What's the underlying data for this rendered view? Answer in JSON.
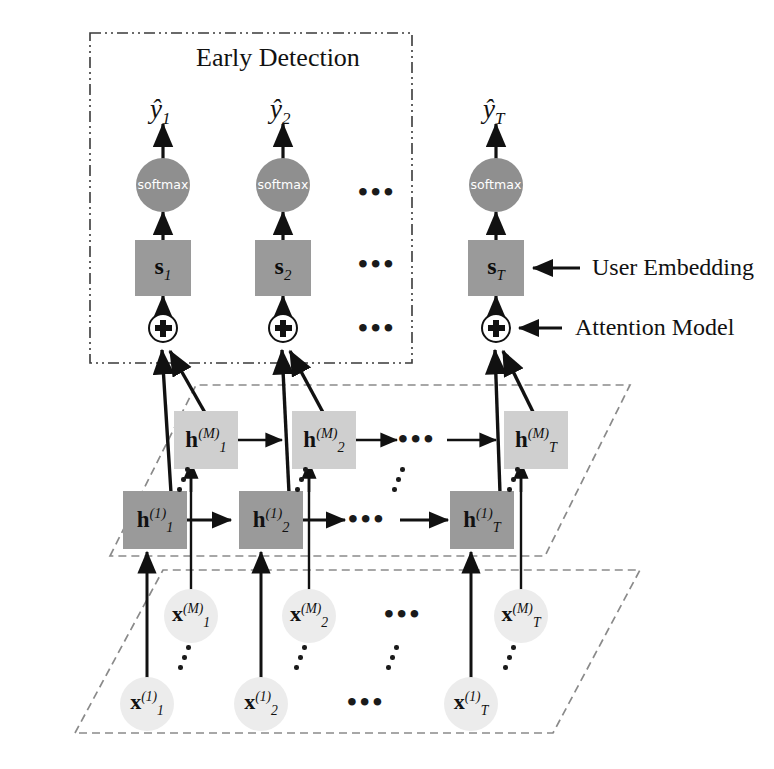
{
  "figure": {
    "title_box": {
      "label": "Early Detection",
      "border_style": "dash-dot"
    },
    "annotations": [
      {
        "name": "user-embedding",
        "label": "User Embedding"
      },
      {
        "name": "attention-model",
        "label": "Attention Model"
      }
    ],
    "ellipsis": "▪ ▪ ▪",
    "colors": {
      "h_layer_1": "#9a9a9a",
      "h_layer_m": "#cfcfcf",
      "s_box": "#9a9a9a",
      "softmax": "#8f8f8f",
      "x_node": "#ececec",
      "stroke": "#111111",
      "dashed_plane": "#888888",
      "background": "#ffffff"
    }
  },
  "output_layer": {
    "name": "prediction-outputs",
    "items": [
      {
        "base": "ŷ",
        "sub": "1"
      },
      {
        "base": "ŷ",
        "sub": "2"
      },
      {
        "base": "ŷ",
        "sub": "T"
      }
    ]
  },
  "softmax_layer": {
    "name": "softmax-layer",
    "label": "softmax",
    "items": [
      {
        "label": "softmax"
      },
      {
        "label": "softmax"
      },
      {
        "label": "softmax"
      }
    ]
  },
  "embedding_layer": {
    "name": "user-embedding-layer",
    "items": [
      {
        "base": "s",
        "sub": "1"
      },
      {
        "base": "s",
        "sub": "2"
      },
      {
        "base": "s",
        "sub": "T"
      }
    ]
  },
  "attention_layer": {
    "name": "attention-sum-layer",
    "symbol": "⊕",
    "items": [
      {
        "symbol": "⊕"
      },
      {
        "symbol": "⊕"
      },
      {
        "symbol": "⊕"
      }
    ]
  },
  "hidden_layer_m": {
    "name": "hidden-layer-m",
    "items": [
      {
        "base": "h",
        "sup": "(M)",
        "sub": "1"
      },
      {
        "base": "h",
        "sup": "(M)",
        "sub": "2"
      },
      {
        "base": "h",
        "sup": "(M)",
        "sub": "T"
      }
    ]
  },
  "hidden_layer_1": {
    "name": "hidden-layer-1",
    "items": [
      {
        "base": "h",
        "sup": "(1)",
        "sub": "1"
      },
      {
        "base": "h",
        "sup": "(1)",
        "sub": "2"
      },
      {
        "base": "h",
        "sup": "(1)",
        "sub": "T"
      }
    ]
  },
  "input_layer_m": {
    "name": "input-layer-m",
    "items": [
      {
        "base": "x",
        "sup": "(M)",
        "sub": "1"
      },
      {
        "base": "x",
        "sup": "(M)",
        "sub": "2"
      },
      {
        "base": "x",
        "sup": "(M)",
        "sub": "T"
      }
    ]
  },
  "input_layer_1": {
    "name": "input-layer-1",
    "items": [
      {
        "base": "x",
        "sup": "(1)",
        "sub": "1"
      },
      {
        "base": "x",
        "sup": "(1)",
        "sub": "2"
      },
      {
        "base": "x",
        "sup": "(1)",
        "sub": "T"
      }
    ]
  }
}
